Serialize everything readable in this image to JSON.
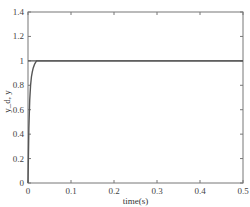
{
  "chart_data": {
    "type": "line",
    "title": "",
    "xlabel": "time(s)",
    "ylabel": "y_d, y",
    "xlim": [
      0,
      0.5
    ],
    "ylim": [
      0,
      1.4
    ],
    "grid": false,
    "legend": null,
    "x_ticks": [
      "0",
      "0.1",
      "0.2",
      "0.3",
      "0.4",
      "0.5"
    ],
    "y_ticks": [
      "0",
      "0.2",
      "0.4",
      "0.6",
      "0.8",
      "1",
      "1.2",
      "1.4"
    ],
    "series": [
      {
        "name": "y_d",
        "color": "#555555",
        "x": [
          0,
          0.5
        ],
        "y": [
          1,
          1
        ]
      },
      {
        "name": "y",
        "color": "#555555",
        "x": [
          0,
          0.002,
          0.004,
          0.006,
          0.008,
          0.01,
          0.012,
          0.015,
          0.018,
          0.02,
          0.03,
          0.5
        ],
        "y": [
          0,
          0.45,
          0.68,
          0.8,
          0.87,
          0.91,
          0.94,
          0.97,
          0.99,
          1.0,
          1.0,
          1.0
        ]
      }
    ]
  },
  "plot": {
    "left": 28,
    "right": 243,
    "top": 12,
    "bottom": 183
  }
}
